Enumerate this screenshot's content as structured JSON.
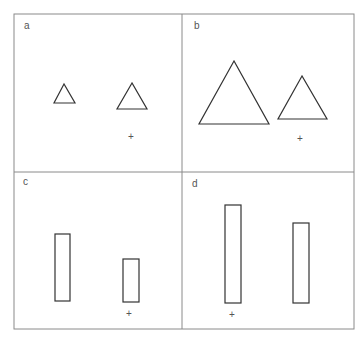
{
  "figure": {
    "panels": [
      {
        "label": "a",
        "shapes": "two small triangles",
        "marker": "+"
      },
      {
        "label": "b",
        "shapes": "two large triangles",
        "marker": "+"
      },
      {
        "label": "c",
        "shapes": "two short rectangles",
        "marker": "+"
      },
      {
        "label": "d",
        "shapes": "two tall rectangles",
        "marker": "+"
      }
    ],
    "stroke_color": "#333333",
    "border_color": "#888888"
  }
}
